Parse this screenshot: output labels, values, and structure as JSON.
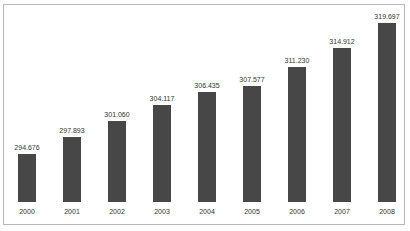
{
  "chart_data": {
    "type": "bar",
    "title": "",
    "xlabel": "",
    "ylabel": "",
    "categories": [
      "2000",
      "2001",
      "2002",
      "2003",
      "2004",
      "2005",
      "2006",
      "2007",
      "2008"
    ],
    "values": [
      294.676,
      297.893,
      301.06,
      304.117,
      306.435,
      307.577,
      311.23,
      314.912,
      319.697
    ],
    "value_labels": [
      "294.676",
      "297.893",
      "301.060",
      "304.117",
      "306.435",
      "307.577",
      "311.230",
      "314.912",
      "319.697"
    ],
    "bar_color": "#474747",
    "grid": false,
    "legend": null,
    "axis_visible": false,
    "data_labels": true
  }
}
